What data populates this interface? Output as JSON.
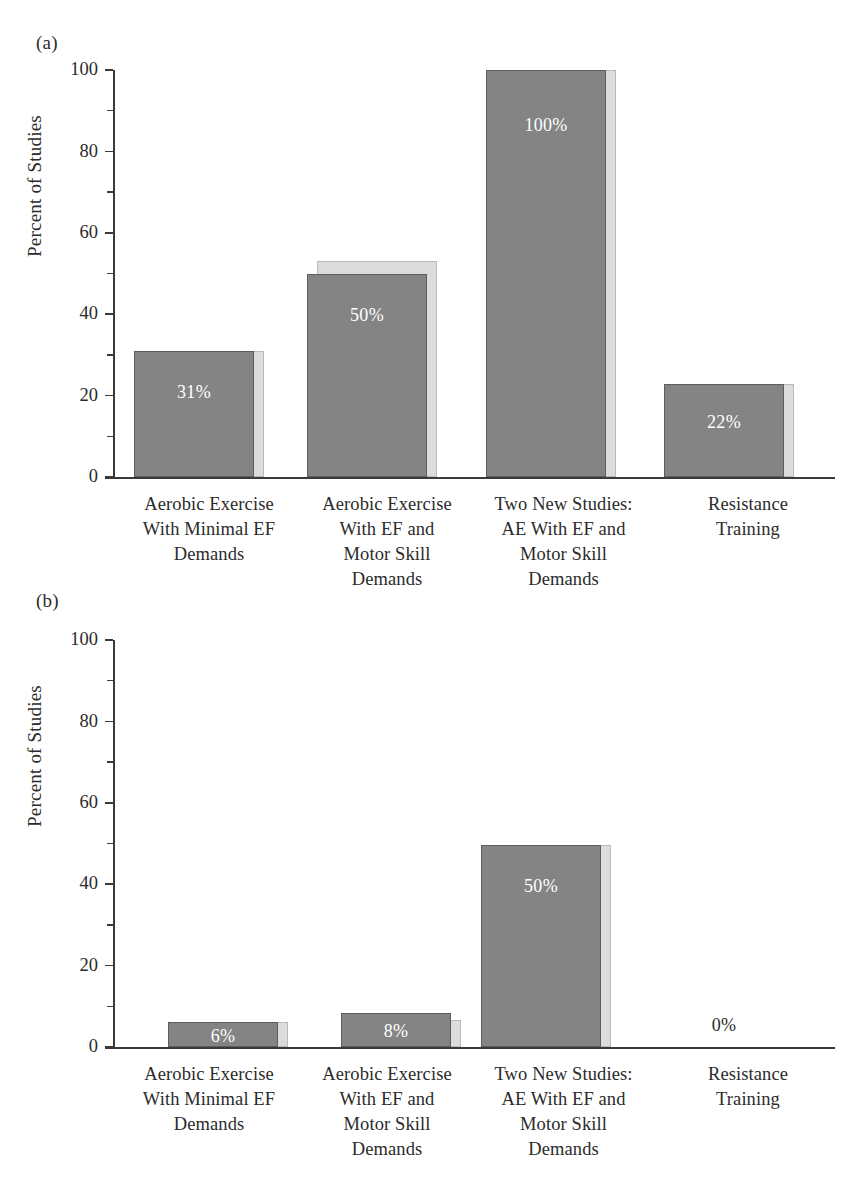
{
  "figure": {
    "panels": [
      {
        "letter": "(a)",
        "ylabel": "Percent of Studies",
        "y_ticks": [
          "0",
          "20",
          "40",
          "60",
          "80",
          "100"
        ]
      },
      {
        "letter": "(b)",
        "ylabel": "Percent of Studies",
        "y_ticks": [
          "0",
          "20",
          "40",
          "60",
          "80",
          "100"
        ]
      }
    ],
    "categories": [
      "Aerobic Exercise\nWith Minimal EF\nDemands",
      "Aerobic Exercise\nWith EF and\nMotor Skill\nDemands",
      "Two New Studies:\nAE With EF and\nMotor Skill\nDemands",
      "Resistance\nTraining"
    ]
  },
  "chart_data": [
    {
      "type": "bar",
      "panel": "(a)",
      "title": "",
      "xlabel": "",
      "ylabel": "Percent of Studies",
      "ylim": [
        0,
        100
      ],
      "yticks": [
        0,
        20,
        40,
        60,
        80,
        100
      ],
      "yminorticks": [
        10,
        30,
        50,
        70,
        90
      ],
      "grid": false,
      "legend": "none",
      "categories": [
        "Aerobic Exercise With Minimal EF Demands",
        "Aerobic Exercise With EF and Motor Skill Demands",
        "Two New Studies: AE With EF and Motor Skill Demands",
        "Resistance Training"
      ],
      "values": [
        31,
        50,
        100,
        22
      ],
      "labels": [
        "31%",
        "50%",
        "100%",
        "22%"
      ],
      "label_position": "inside",
      "bar_color": "#848484",
      "bar_shadow_color": "#dcdcdc",
      "label_color": "#ffffff"
    },
    {
      "type": "bar",
      "panel": "(b)",
      "title": "",
      "xlabel": "",
      "ylabel": "Percent of Studies",
      "ylim": [
        0,
        100
      ],
      "yticks": [
        0,
        20,
        40,
        60,
        80,
        100
      ],
      "yminorticks": [
        10,
        30,
        50,
        70,
        90
      ],
      "grid": false,
      "legend": "none",
      "categories": [
        "Aerobic Exercise With Minimal EF Demands",
        "Aerobic Exercise With EF and Motor Skill Demands",
        "Two New Studies: AE With EF and Motor Skill Demands",
        "Resistance Training"
      ],
      "values": [
        6,
        8,
        50,
        0
      ],
      "labels": [
        "6%",
        "8%",
        "50%",
        "0%"
      ],
      "label_position": "inside",
      "bar_color": "#848484",
      "bar_shadow_color": "#dcdcdc",
      "label_color": "#ffffff"
    }
  ]
}
